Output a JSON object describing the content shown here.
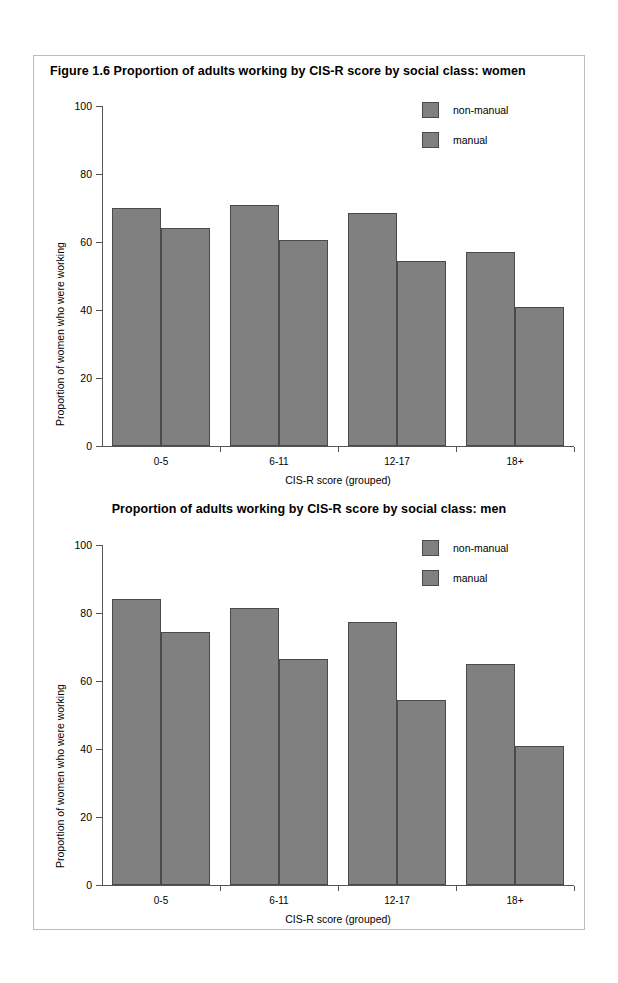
{
  "document": {
    "figure_number": "Figure 1.6",
    "panel_background": "#ffffff",
    "bar_color": "#808080",
    "bar_outline_color": "#4a4a4a",
    "axis_color": "#555555"
  },
  "charts": [
    {
      "id": "women",
      "title": "Figure 1.6   Proportion of adults working by CIS-R score by social class: women",
      "xlabel": "CIS-R score (grouped)",
      "ylabel": "Proportion of women who were working",
      "categories": [
        "0-5",
        "6-11",
        "12-17",
        "18+"
      ],
      "yticks": [
        "0",
        "20",
        "40",
        "60",
        "80",
        "100"
      ],
      "legend": [
        {
          "label": "non-manual",
          "color": "#808080"
        },
        {
          "label": "manual",
          "color": "#808080"
        }
      ]
    },
    {
      "id": "men",
      "title": "Proportion of adults working by CIS-R score by social class: men",
      "xlabel": "CIS-R score (grouped)",
      "ylabel": "Proportion of women who were working",
      "categories": [
        "0-5",
        "6-11",
        "12-17",
        "18+"
      ],
      "yticks": [
        "0",
        "20",
        "40",
        "60",
        "80",
        "100"
      ],
      "legend": [
        {
          "label": "non-manual",
          "color": "#808080"
        },
        {
          "label": "manual",
          "color": "#808080"
        }
      ]
    }
  ],
  "chart_data": [
    {
      "type": "bar",
      "title": "Figure 1.6   Proportion of adults working by CIS-R score by social class: women",
      "xlabel": "CIS-R score (grouped)",
      "ylabel": "Proportion of women who were working",
      "categories": [
        "0-5",
        "6-11",
        "12-17",
        "18+"
      ],
      "series": [
        {
          "name": "non-manual",
          "values": [
            70,
            71,
            68.5,
            57
          ],
          "color": "#808080"
        },
        {
          "name": "manual",
          "values": [
            64,
            60.5,
            54.5,
            41
          ],
          "color": "#808080"
        }
      ],
      "ylim": [
        0,
        100
      ],
      "yticks": [
        0,
        20,
        40,
        60,
        80,
        100
      ],
      "grid": false,
      "legend_position": "top-right"
    },
    {
      "type": "bar",
      "title": "Proportion of adults working by CIS-R score by social class: men",
      "xlabel": "CIS-R score (grouped)",
      "ylabel": "Proportion of women who were working",
      "categories": [
        "0-5",
        "6-11",
        "12-17",
        "18+"
      ],
      "series": [
        {
          "name": "non-manual",
          "values": [
            84,
            81.5,
            77.5,
            65
          ],
          "color": "#808080"
        },
        {
          "name": "manual",
          "values": [
            74.5,
            66.5,
            54.5,
            41
          ],
          "color": "#808080"
        }
      ],
      "ylim": [
        0,
        100
      ],
      "yticks": [
        0,
        20,
        40,
        60,
        80,
        100
      ],
      "grid": false,
      "legend_position": "top-right"
    }
  ]
}
